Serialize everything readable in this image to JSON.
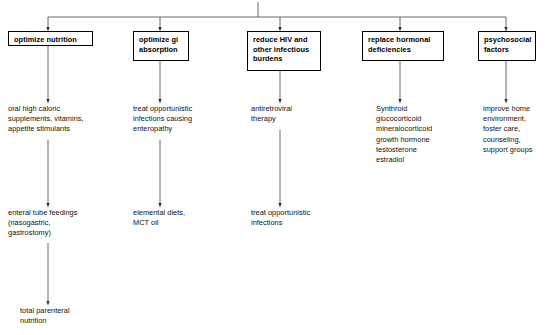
{
  "diagram": {
    "type": "flowchart",
    "orientation": "top-down",
    "line_color": "#444444",
    "text_color": "#000000",
    "box_border_color": "#000000",
    "background_color": "#ffffff",
    "root_connector": "horizontal-bus-with-center-stem"
  },
  "columns": [
    {
      "id": "optimize-nutrition",
      "header": "optimize nutrition",
      "nodes": [
        "oral high caloric\nsupplements, vitamins,\nappetite stimulants",
        "enteral tube feedings\n(nasogastric,\n  gastrostomy)",
        "total parenteral\nnutrition"
      ]
    },
    {
      "id": "optimize-gi-absorption",
      "header": "optimize gi\nabsorption",
      "nodes": [
        "treat opportunistic\ninfections causing\nenteropathy",
        "elemental diets,\nMCT oil"
      ]
    },
    {
      "id": "reduce-hiv-and-other-infectious-burdens",
      "header": "reduce HIV and\nother infectious\nburdens",
      "nodes": [
        "antiretroviral\ntherapy",
        "treat opportunistic\ninfections"
      ]
    },
    {
      "id": "replace-hormonal-deficiencies",
      "header": "replace hormonal\ndeficiencies",
      "nodes": [
        "Synthroid\nglucocorticoid\nmineralocorticoid\ngrowth hormone\ntestosterone\nestradiol"
      ]
    },
    {
      "id": "psychosocial-factors",
      "header": "psychosocial\nfactors",
      "nodes": [
        "improve home\nenvironment,\nfoster care,\ncounseling,\nsupport groups"
      ]
    }
  ]
}
